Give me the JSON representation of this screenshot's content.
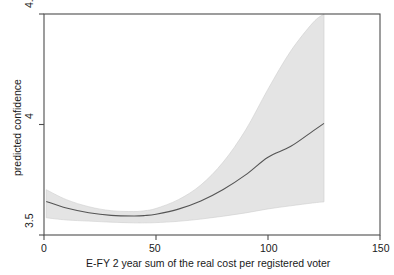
{
  "chart_data": {
    "type": "line",
    "title": "",
    "subtitle": "",
    "xlabel": "E-FY 2 year sum of the real cost per registered voter",
    "ylabel": "predicted confidence",
    "xlim": [
      0,
      150
    ],
    "ylim": [
      3.5,
      4.5
    ],
    "xticks": [
      0,
      50,
      100,
      150
    ],
    "xticklabels": [
      "0",
      "50",
      "100",
      "150"
    ],
    "yticks": [
      3.5,
      4,
      4.5
    ],
    "yticklabels": [
      "3.5",
      "4",
      "4.5"
    ],
    "grid": false,
    "legend": null,
    "legend_position": "none",
    "series": [
      {
        "name": "predicted confidence",
        "type": "line",
        "color": "#555555",
        "x": [
          1,
          10,
          20,
          30,
          40,
          45,
          50,
          60,
          70,
          80,
          90,
          100,
          110,
          120,
          125
        ],
        "values": [
          3.652,
          3.622,
          3.601,
          3.589,
          3.586,
          3.588,
          3.594,
          3.617,
          3.654,
          3.706,
          3.772,
          3.852,
          3.9,
          3.97,
          4.005
        ]
      },
      {
        "name": "confidence interval upper",
        "type": "band-upper",
        "color": "#e4e4e4",
        "x": [
          1,
          10,
          20,
          30,
          40,
          45,
          50,
          60,
          70,
          80,
          90,
          100,
          110,
          120,
          125
        ],
        "values": [
          3.705,
          3.66,
          3.628,
          3.61,
          3.606,
          3.61,
          3.62,
          3.66,
          3.726,
          3.83,
          3.975,
          4.16,
          4.33,
          4.46,
          4.5
        ]
      },
      {
        "name": "confidence interval lower",
        "type": "band-lower",
        "color": "#e4e4e4",
        "x": [
          1,
          10,
          20,
          30,
          40,
          45,
          50,
          60,
          70,
          80,
          90,
          100,
          110,
          120,
          125
        ],
        "values": [
          3.578,
          3.568,
          3.563,
          3.558,
          3.555,
          3.555,
          3.556,
          3.562,
          3.572,
          3.585,
          3.6,
          3.618,
          3.632,
          3.645,
          3.65
        ]
      }
    ],
    "annotations": []
  },
  "axes": {
    "y_tick_0": "3.5",
    "y_tick_1": "4",
    "y_tick_2": "4.5",
    "x_tick_0": "0",
    "x_tick_1": "50",
    "x_tick_2": "100",
    "x_tick_3": "150",
    "y_axis_title": "predicted confidence",
    "x_axis_title": "E-FY 2 year sum of the real cost per registered voter"
  },
  "colors": {
    "band_fill": "#e4e4e4",
    "band_edge": "#c9c9c9",
    "line": "#555555",
    "frame": "#4d4d4d",
    "text": "#1a1a1a",
    "background": "#ffffff"
  }
}
